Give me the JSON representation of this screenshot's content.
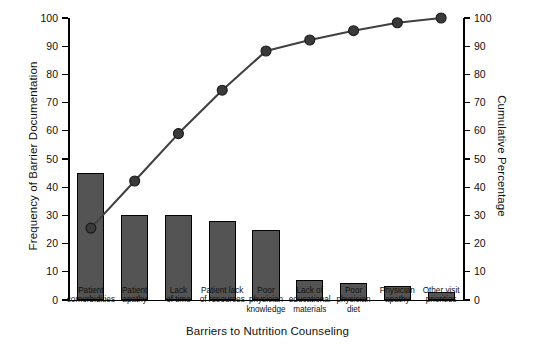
{
  "chart_data": {
    "type": "bar",
    "subtype": "pareto",
    "title": "",
    "xlabel": "Barriers to Nutrition Counseling",
    "ylabel": "Frequency of Barrier Documentation",
    "y2label": "Cumulative Percentage",
    "categories": [
      "Patient comorbidities",
      "Patient apathy",
      "Lack of time",
      "Patient lack of resources",
      "Poor physician knowledge",
      "Lack of educational materials",
      "Poor physician diet",
      "Physician apathy",
      "Other visit priorities"
    ],
    "category_lines": [
      [
        "Patient",
        "comorbidities"
      ],
      [
        "Patient",
        "apathy"
      ],
      [
        "Lack",
        "of time"
      ],
      [
        "Patient lack",
        "of resources"
      ],
      [
        "Poor",
        "physician",
        "knowledge"
      ],
      [
        "Lack of",
        "educational",
        "materials"
      ],
      [
        "Poor",
        "physician",
        "diet"
      ],
      [
        "Physician",
        "apathy"
      ],
      [
        "Other visit",
        "priorities"
      ]
    ],
    "series": [
      {
        "name": "Frequency of Barrier Documentation",
        "type": "bar",
        "axis": "left",
        "values": [
          45,
          30,
          30,
          28,
          25,
          7,
          6,
          5,
          3
        ]
      },
      {
        "name": "Cumulative Percentage",
        "type": "line",
        "axis": "right",
        "values": [
          25.5,
          42.2,
          59.0,
          74.4,
          88.3,
          92.2,
          95.5,
          98.3,
          100.0
        ]
      }
    ],
    "ylim": [
      0,
      100
    ],
    "y2lim": [
      0,
      100
    ],
    "ytick_labels": [
      "0",
      "10",
      "20",
      "30",
      "40",
      "50",
      "60",
      "70",
      "80",
      "90",
      "100"
    ],
    "y2tick_labels": [
      "0",
      "10",
      "20",
      "30",
      "40",
      "50",
      "60",
      "70",
      "80",
      "90",
      "100"
    ],
    "ytick_values": [
      0,
      10,
      20,
      30,
      40,
      50,
      60,
      70,
      80,
      90,
      100
    ],
    "grid": false,
    "legend": "none",
    "colors": {
      "bar_fill": "#545454",
      "bar_edge": "#000000",
      "line": "#404040",
      "marker": "#3a3a3a",
      "axis": "#000000",
      "background": "#ffffff"
    }
  }
}
